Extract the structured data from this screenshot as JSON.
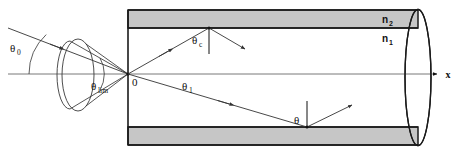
{
  "figure": {
    "labels": {
      "theta0": "θ",
      "theta0_sub": "0",
      "theta_lim": "θ",
      "theta_lim_sub": "lim",
      "theta_c": "θ",
      "theta_c_sub": "c",
      "theta_1": "θ",
      "theta_1_sub": "1",
      "theta_bottom": "θ",
      "origin": "0",
      "axis_x": "x",
      "n2": "n",
      "n2_sub": "2",
      "n1": "n",
      "n1_sub": "1"
    },
    "colors": {
      "background": "#ffffff",
      "cladding_fill": "#c6c6c6",
      "fiber_border": "#1a1a1a",
      "ray_stroke": "#333333",
      "axis_stroke": "#555555",
      "text": "#111111"
    },
    "geometry": {
      "width": 463,
      "height": 155,
      "fiber_left_x": 128,
      "fiber_right_x": 418,
      "fiber_top_y": 10,
      "fiber_bottom_y": 145,
      "cladding_thickness": 18,
      "axis_y": 74,
      "origin_x": 128,
      "origin_y": 74
    },
    "elements": {
      "incident_ray": "incident ray entering at angle theta-0 to the optical axis",
      "lens": "converging lens shown as ellipse",
      "acceptance_cone": "cone of accepted rays converging to origin at fiber input face",
      "core": "fiber core with refractive index n1",
      "cladding": "fiber cladding with refractive index n2",
      "guided_ray_upper": "ray striking the core-cladding interface at the critical angle theta-c",
      "guided_ray_lower": "ray striking the lower interface at angle theta",
      "end_face": "fiber output end face shown as ellipse"
    }
  }
}
